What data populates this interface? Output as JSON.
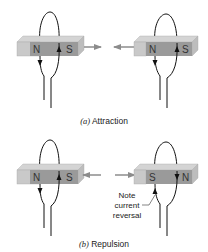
{
  "figure": {
    "panels": [
      {
        "id": "a",
        "caption_letter": "(a)",
        "caption_text": "Attraction",
        "left_magnet": {
          "left_pole": "N",
          "right_pole": "S"
        },
        "right_magnet": {
          "left_pole": "N",
          "right_pole": "S"
        },
        "arrows": "toward each other"
      },
      {
        "id": "b",
        "caption_letter": "(b)",
        "caption_text": "Repulsion",
        "left_magnet": {
          "left_pole": "N",
          "right_pole": "S"
        },
        "right_magnet": {
          "left_pole": "S",
          "right_pole": "N"
        },
        "arrows": "away from each other",
        "annotation": [
          "Note",
          "current",
          "reversal"
        ]
      }
    ],
    "colors": {
      "magnet_top": "#d4d4d4",
      "magnet_front": "#9a9a9a",
      "magnet_side": "#bdbdbd",
      "arrow": "#8c8c8c",
      "wire": "#111111"
    }
  }
}
